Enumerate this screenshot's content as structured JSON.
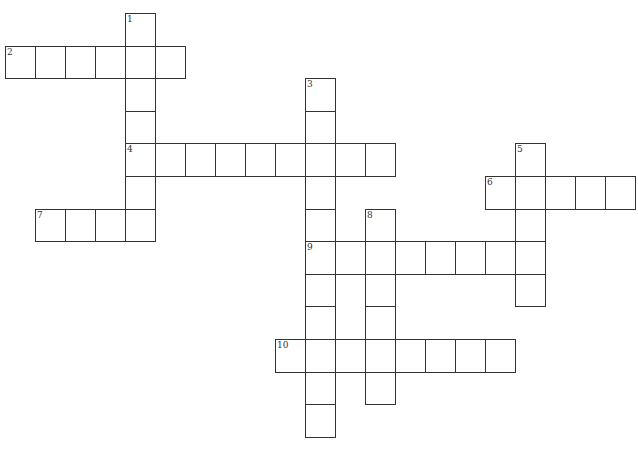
{
  "puzzle": {
    "cell_w": 30,
    "cell_h": 32.6,
    "origin_x": 5,
    "origin_y": 13,
    "words": [
      {
        "number": "1",
        "direction": "down",
        "col": 4,
        "row": 0,
        "length": 7
      },
      {
        "number": "2",
        "direction": "across",
        "col": 0,
        "row": 1,
        "length": 6
      },
      {
        "number": "3",
        "direction": "down",
        "col": 10,
        "row": 2,
        "length": 11
      },
      {
        "number": "4",
        "direction": "across",
        "col": 4,
        "row": 4,
        "length": 9
      },
      {
        "number": "5",
        "direction": "down",
        "col": 17,
        "row": 4,
        "length": 5
      },
      {
        "number": "6",
        "direction": "across",
        "col": 16,
        "row": 5,
        "length": 5
      },
      {
        "number": "7",
        "direction": "across",
        "col": 1,
        "row": 6,
        "length": 4
      },
      {
        "number": "8",
        "direction": "down",
        "col": 12,
        "row": 6,
        "length": 6
      },
      {
        "number": "9",
        "direction": "across",
        "col": 10,
        "row": 7,
        "length": 8
      },
      {
        "number": "10",
        "direction": "across",
        "col": 9,
        "row": 10,
        "length": 8
      }
    ]
  }
}
